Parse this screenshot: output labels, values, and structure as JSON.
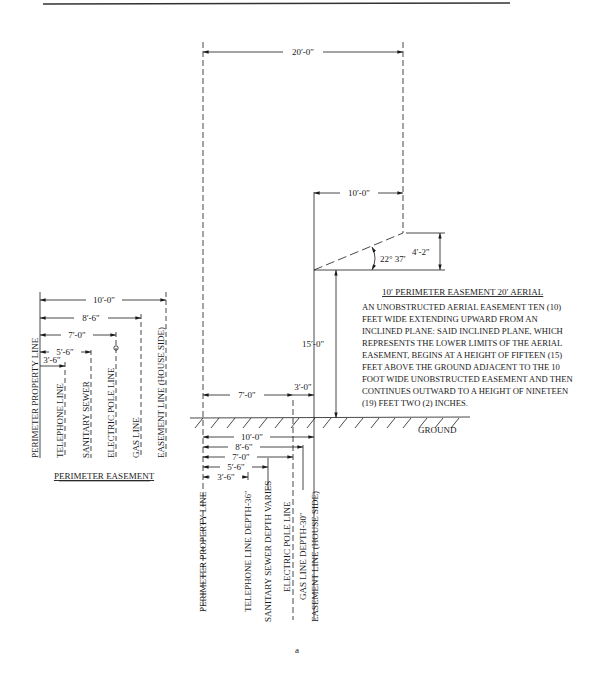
{
  "figure_label": "a",
  "perimeter_easement": {
    "title": "PERIMETER EASEMENT",
    "lines": [
      {
        "label": "PERIMETER PROPERTY LINE"
      },
      {
        "label": "TELEPHONE LINE",
        "dim": "3′-6″"
      },
      {
        "label": "SANITARY SEWER",
        "dim": "5′-6″"
      },
      {
        "label": "ELECTRIC POLE LINE",
        "dim": "7′-0″"
      },
      {
        "label": "GAS LINE",
        "dim": "8′-6″"
      },
      {
        "label": "EASEMENT LINE (HOUSE SIDE)",
        "dim": "10′-0″"
      }
    ]
  },
  "aerial": {
    "width_total": "20′-0″",
    "width_aerial": "10′-0″",
    "angle": "22° 37′",
    "rise": "4′-2″",
    "height": "15′-0″",
    "ground_left": "7′-0″",
    "ground_mid": "3′-0″",
    "ground_label": "GROUND"
  },
  "note": {
    "title": "10′ PERIMETER EASEMENT 20′ AERIAL",
    "lines": [
      "AN UNOBSTRUCTED AERIAL EASEMENT TEN (10)",
      "FEET WIDE EXTENDING UPWARD FROM AN",
      "INCLINED PLANE: SAID INCLINED PLANE, WHICH",
      "REPRESENTS THE LOWER LIMITS OF THE AERIAL",
      "EASEMENT, BEGINS AT A HEIGHT OF FIFTEEN (15)",
      "FEET ABOVE THE GROUND ADJACENT TO THE 10",
      "FOOT WIDE UNOBSTRUCTED EASEMENT AND THEN",
      "CONTINUES OUTWARD TO A HEIGHT OF NINETEEN",
      "(19) FEET TWO (2) INCHES."
    ]
  },
  "underground": {
    "dims": [
      "10′-0″",
      "8′-6″",
      "7′-0″",
      "5′-6″",
      "3′-6″"
    ],
    "labels": [
      "PERIMETER PROPERTY LINE",
      "TELEPHONE LINE  DEPTH-36″",
      "SANITARY SEWER DEPTH VARIES",
      "ELECTRIC POLE LINE",
      "GAS LINE  DEPTH-30″",
      "EASEMENT LINE (HOUSE SIDE)"
    ]
  }
}
